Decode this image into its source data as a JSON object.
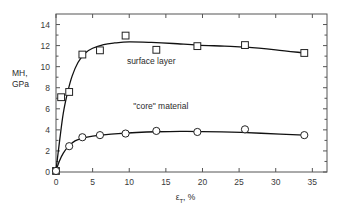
{
  "chart_data": {
    "type": "scatter",
    "title": "",
    "xlabel": "εT, %",
    "xlabel_base": "ε",
    "xlabel_sub": "T",
    "xlabel_unit": ", %",
    "ylabel": "MH, GPa",
    "ylabel_line1": "MH,",
    "ylabel_line2": "GPa",
    "xlim": [
      0,
      37
    ],
    "ylim": [
      0,
      15
    ],
    "xticks": [
      0,
      5,
      10,
      15,
      20,
      25,
      30,
      35
    ],
    "yticks": [
      0,
      2,
      4,
      6,
      8,
      10,
      12,
      14
    ],
    "xtick_labels": [
      "0",
      "5",
      "10",
      "15",
      "20",
      "25",
      "30",
      "35"
    ],
    "ytick_labels": [
      "0",
      "2",
      "4",
      "6",
      "8",
      "10",
      "12",
      "14"
    ],
    "grid": false,
    "frame": "box",
    "legend": "inline-annotations",
    "series": [
      {
        "name": "surface layer",
        "marker": "square",
        "annotation": "surface layer",
        "annotation_x": 13.0,
        "annotation_y": 10.3,
        "points": [
          {
            "x": 0.0,
            "y": 0.1
          },
          {
            "x": 0.7,
            "y": 7.1
          },
          {
            "x": 1.8,
            "y": 7.6
          },
          {
            "x": 3.6,
            "y": 11.15
          },
          {
            "x": 6.0,
            "y": 11.55
          },
          {
            "x": 9.5,
            "y": 12.95
          },
          {
            "x": 13.7,
            "y": 11.6
          },
          {
            "x": 19.3,
            "y": 11.95
          },
          {
            "x": 25.8,
            "y": 12.05
          },
          {
            "x": 33.9,
            "y": 11.3
          }
        ],
        "fit_curve": [
          {
            "x": 0.0,
            "y": 0.15
          },
          {
            "x": 0.5,
            "y": 3.0
          },
          {
            "x": 1.0,
            "y": 5.6
          },
          {
            "x": 1.6,
            "y": 7.6
          },
          {
            "x": 2.2,
            "y": 9.1
          },
          {
            "x": 3.0,
            "y": 10.4
          },
          {
            "x": 4.0,
            "y": 11.3
          },
          {
            "x": 5.0,
            "y": 11.75
          },
          {
            "x": 6.5,
            "y": 12.1
          },
          {
            "x": 8.0,
            "y": 12.25
          },
          {
            "x": 10.0,
            "y": 12.35
          },
          {
            "x": 13.0,
            "y": 12.3
          },
          {
            "x": 16.0,
            "y": 12.2
          },
          {
            "x": 19.3,
            "y": 12.05
          },
          {
            "x": 23.0,
            "y": 11.95
          },
          {
            "x": 26.0,
            "y": 11.85
          },
          {
            "x": 30.0,
            "y": 11.6
          },
          {
            "x": 33.9,
            "y": 11.3
          }
        ]
      },
      {
        "name": "\"core\" material",
        "marker": "circle",
        "annotation": "\"core\" material",
        "annotation_x": 14.3,
        "annotation_y": 6.0,
        "points": [
          {
            "x": 0.0,
            "y": 0.1
          },
          {
            "x": 1.8,
            "y": 2.45
          },
          {
            "x": 3.6,
            "y": 3.3
          },
          {
            "x": 6.0,
            "y": 3.5
          },
          {
            "x": 9.5,
            "y": 3.65
          },
          {
            "x": 13.7,
            "y": 3.9
          },
          {
            "x": 19.3,
            "y": 3.8
          },
          {
            "x": 25.8,
            "y": 4.05
          },
          {
            "x": 33.9,
            "y": 3.5
          }
        ],
        "fit_curve": [
          {
            "x": 0.0,
            "y": 0.15
          },
          {
            "x": 0.5,
            "y": 1.1
          },
          {
            "x": 1.0,
            "y": 1.8
          },
          {
            "x": 1.8,
            "y": 2.5
          },
          {
            "x": 2.6,
            "y": 2.95
          },
          {
            "x": 3.6,
            "y": 3.2
          },
          {
            "x": 5.0,
            "y": 3.4
          },
          {
            "x": 6.5,
            "y": 3.52
          },
          {
            "x": 8.5,
            "y": 3.64
          },
          {
            "x": 11.0,
            "y": 3.75
          },
          {
            "x": 13.7,
            "y": 3.82
          },
          {
            "x": 17.0,
            "y": 3.85
          },
          {
            "x": 20.0,
            "y": 3.84
          },
          {
            "x": 24.0,
            "y": 3.78
          },
          {
            "x": 28.0,
            "y": 3.68
          },
          {
            "x": 33.9,
            "y": 3.5
          }
        ]
      }
    ]
  }
}
